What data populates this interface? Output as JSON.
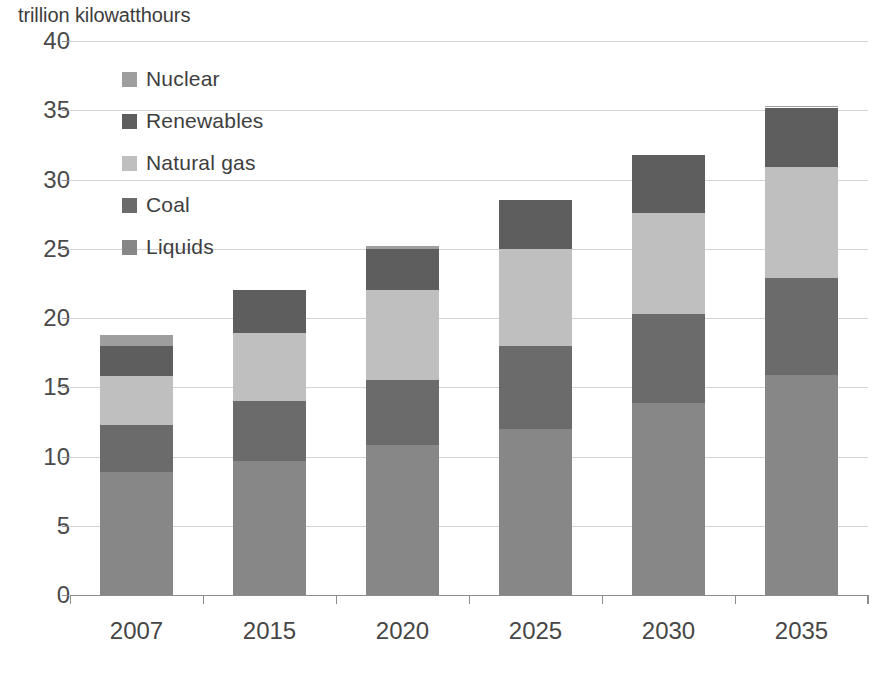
{
  "chart_data": {
    "type": "bar",
    "subtype": "stacked",
    "title": "",
    "ylabel": "trillion kilowatthours",
    "xlabel": "",
    "ylim": [
      0,
      40
    ],
    "ytick_step": 5,
    "ytick_labels": [
      "40",
      "35",
      "30",
      "25",
      "20",
      "15",
      "10",
      "5",
      "0"
    ],
    "ytick_values": [
      40,
      35,
      30,
      25,
      20,
      15,
      10,
      5,
      0
    ],
    "grid": true,
    "legend_position": "upper-left-inside",
    "categories": [
      "2007",
      "2015",
      "2020",
      "2025",
      "2030",
      "2035"
    ],
    "stack_order_bottom_to_top": [
      "Liquids",
      "Coal",
      "Natural gas",
      "Renewables",
      "Nuclear"
    ],
    "series": [
      {
        "name": "Liquids",
        "color": "#878787",
        "values": [
          8.9,
          9.7,
          10.8,
          12.0,
          13.9,
          15.9
        ]
      },
      {
        "name": "Coal",
        "color": "#6b6b6b",
        "values": [
          3.4,
          4.3,
          4.7,
          6.0,
          6.4,
          7.0
        ]
      },
      {
        "name": "Natural gas",
        "color": "#bfbfbf",
        "values": [
          3.5,
          4.9,
          6.5,
          7.0,
          7.3,
          8.0
        ]
      },
      {
        "name": "Renewables",
        "color": "#5e5e5e",
        "values": [
          2.2,
          3.1,
          3.0,
          3.5,
          4.2,
          4.3
        ]
      },
      {
        "name": "Nuclear",
        "color": "#9e9e9e",
        "values": [
          0.8,
          0.0,
          0.2,
          0.0,
          0.0,
          0.1
        ]
      }
    ],
    "totals": [
      18.8,
      22.0,
      25.2,
      28.5,
      31.8,
      35.3
    ]
  },
  "legend": {
    "items": [
      {
        "label": "Nuclear",
        "color": "#9e9e9e"
      },
      {
        "label": "Renewables",
        "color": "#5e5e5e"
      },
      {
        "label": "Natural gas",
        "color": "#bfbfbf"
      },
      {
        "label": "Coal",
        "color": "#6b6b6b"
      },
      {
        "label": "Liquids",
        "color": "#878787"
      }
    ]
  },
  "colors": {
    "gridline": "#d3d3d3",
    "axis": "#8d8d8d",
    "text": "#3e3e3e",
    "background": "#ffffff"
  }
}
